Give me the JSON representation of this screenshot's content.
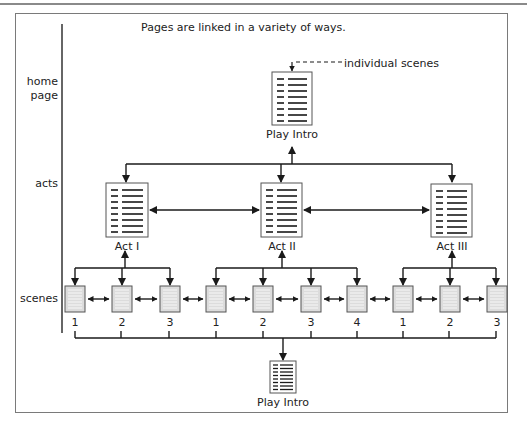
{
  "title": "Pages are linked in a variety of ways.",
  "annotation": "individual scenes",
  "levels": {
    "home_page": [
      "home",
      "page"
    ],
    "acts": "acts",
    "scenes": "scenes"
  },
  "home": {
    "label": "Play Intro"
  },
  "acts": [
    {
      "label": "Act I",
      "scenes": [
        "1",
        "2",
        "3"
      ]
    },
    {
      "label": "Act II",
      "scenes": [
        "1",
        "2",
        "3",
        "4"
      ]
    },
    {
      "label": "Act III",
      "scenes": [
        "1",
        "2",
        "3"
      ]
    }
  ],
  "footer_page": {
    "label": "Play Intro"
  },
  "colors": {
    "line": "#1a1a1a",
    "page_border": "#555555",
    "scene_fill": "#dcdcdc",
    "frame": "#7a7a7a"
  }
}
